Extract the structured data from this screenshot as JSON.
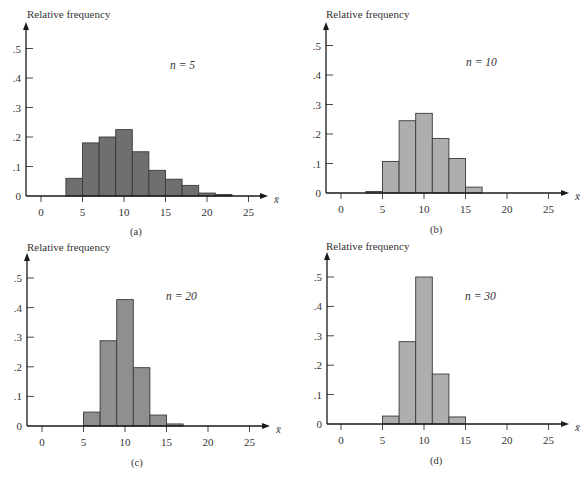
{
  "figure": {
    "bar_stroke": "#3a3a3a",
    "axis_color": "#1a1a1a"
  },
  "chart_data": [
    {
      "id": "a",
      "type": "bar",
      "panel_label": "(a)",
      "annotation": "n = 5",
      "n": 5,
      "title": "",
      "xlabel": "x̄",
      "ylabel": "Relative frequency",
      "x_ticks": [
        0,
        5,
        10,
        15,
        20,
        25
      ],
      "y_ticks": [
        0,
        0.1,
        0.2,
        0.3,
        0.4,
        0.5
      ],
      "y_tick_labels": [
        "0",
        ".1",
        ".2",
        ".3",
        ".4",
        ".5"
      ],
      "xlim": [
        -2,
        27
      ],
      "ylim": [
        0,
        0.55
      ],
      "grid": false,
      "bar_color": "#6f6f6f",
      "bins": [
        [
          3,
          5
        ],
        [
          5,
          7
        ],
        [
          7,
          9
        ],
        [
          9,
          11
        ],
        [
          11,
          13
        ],
        [
          13,
          15
        ],
        [
          15,
          17
        ],
        [
          17,
          19
        ],
        [
          19,
          21
        ],
        [
          21,
          23
        ]
      ],
      "values": [
        0.06,
        0.18,
        0.2,
        0.225,
        0.15,
        0.087,
        0.057,
        0.036,
        0.01,
        0.005
      ],
      "layout": {
        "axis_x": 26,
        "base_y": 196,
        "x0": 41,
        "px_per_unit": 8.3,
        "px_per_one": 295,
        "top_y": 22,
        "arrow_end": 268,
        "ylabel_x": 27,
        "ylabel_y": 18,
        "n_x": 170,
        "n_y": 69,
        "panel_x": 130,
        "panel_y": 235,
        "xbar_x": 274,
        "xbar_y": 199
      }
    },
    {
      "id": "b",
      "type": "bar",
      "panel_label": "(b)",
      "annotation": "n = 10",
      "n": 10,
      "title": "",
      "xlabel": "x̄",
      "ylabel": "Relative frequency",
      "x_ticks": [
        0,
        5,
        10,
        15,
        20,
        25
      ],
      "y_ticks": [
        0,
        0.1,
        0.2,
        0.3,
        0.4,
        0.5
      ],
      "y_tick_labels": [
        "0",
        ".1",
        ".2",
        ".3",
        ".4",
        ".5"
      ],
      "xlim": [
        -2,
        27
      ],
      "ylim": [
        0,
        0.55
      ],
      "grid": false,
      "bar_color": "#aeaeae",
      "bins": [
        [
          3,
          5
        ],
        [
          5,
          7
        ],
        [
          7,
          9
        ],
        [
          9,
          11
        ],
        [
          11,
          13
        ],
        [
          13,
          15
        ],
        [
          15,
          17
        ]
      ],
      "values": [
        0.005,
        0.107,
        0.245,
        0.27,
        0.185,
        0.117,
        0.02
      ],
      "layout": {
        "axis_x": 326,
        "base_y": 193,
        "x0": 341,
        "px_per_unit": 8.3,
        "px_per_one": 295,
        "top_y": 22,
        "arrow_end": 569,
        "ylabel_x": 326,
        "ylabel_y": 18,
        "n_x": 466,
        "n_y": 66,
        "panel_x": 430,
        "panel_y": 233,
        "xbar_x": 575,
        "xbar_y": 196
      }
    },
    {
      "id": "c",
      "type": "bar",
      "panel_label": "(c)",
      "annotation": "n = 20",
      "n": 20,
      "title": "",
      "xlabel": "x̄",
      "ylabel": "Relative frequency",
      "x_ticks": [
        0,
        5,
        10,
        15,
        20,
        25
      ],
      "y_ticks": [
        0,
        0.1,
        0.2,
        0.3,
        0.4,
        0.5
      ],
      "y_tick_labels": [
        "0",
        ".1",
        ".2",
        ".3",
        ".4",
        ".5"
      ],
      "xlim": [
        -2,
        27
      ],
      "ylim": [
        0,
        0.55
      ],
      "grid": false,
      "bar_color": "#8f8f8f",
      "bins": [
        [
          5,
          7
        ],
        [
          7,
          9
        ],
        [
          9,
          11
        ],
        [
          11,
          13
        ],
        [
          13,
          15
        ],
        [
          15,
          17
        ]
      ],
      "values": [
        0.047,
        0.288,
        0.427,
        0.197,
        0.037,
        0.007
      ],
      "layout": {
        "axis_x": 27,
        "base_y": 426,
        "x0": 42,
        "px_per_unit": 8.3,
        "px_per_one": 296,
        "top_y": 253,
        "arrow_end": 270,
        "ylabel_x": 27,
        "ylabel_y": 251,
        "n_x": 166,
        "n_y": 300,
        "panel_x": 131,
        "panel_y": 466,
        "xbar_x": 276,
        "xbar_y": 429
      }
    },
    {
      "id": "d",
      "type": "bar",
      "panel_label": "(d)",
      "annotation": "n = 30",
      "n": 30,
      "title": "",
      "xlabel": "x̄",
      "ylabel": "Relative frequency",
      "x_ticks": [
        0,
        5,
        10,
        15,
        20,
        25
      ],
      "y_ticks": [
        0,
        0.1,
        0.2,
        0.3,
        0.4,
        0.5
      ],
      "y_tick_labels": [
        "0",
        ".1",
        ".2",
        ".3",
        ".4",
        ".5"
      ],
      "xlim": [
        -2,
        27
      ],
      "ylim": [
        0,
        0.55
      ],
      "grid": false,
      "bar_color": "#aeaeae",
      "bins": [
        [
          5,
          7
        ],
        [
          7,
          9
        ],
        [
          9,
          11
        ],
        [
          11,
          13
        ],
        [
          13,
          15
        ]
      ],
      "values": [
        0.027,
        0.28,
        0.5,
        0.17,
        0.024
      ],
      "layout": {
        "axis_x": 327,
        "base_y": 424,
        "x0": 341,
        "px_per_unit": 8.3,
        "px_per_one": 294,
        "top_y": 252,
        "arrow_end": 569,
        "ylabel_x": 326,
        "ylabel_y": 250,
        "n_x": 465,
        "n_y": 300,
        "panel_x": 430,
        "panel_y": 464,
        "xbar_x": 575,
        "xbar_y": 427
      }
    }
  ]
}
